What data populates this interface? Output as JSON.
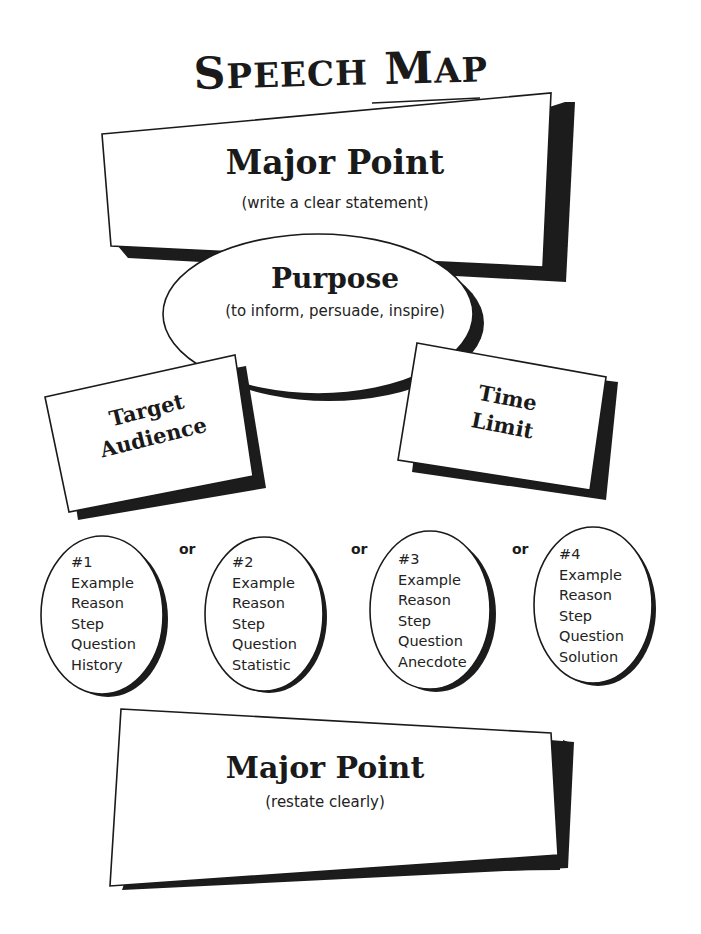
{
  "title": {
    "first_initial": "S",
    "first_rest": "PEECH",
    "second_initial": "M",
    "second_rest": "AP",
    "full": "Speech Map"
  },
  "opening_point": {
    "heading": "Major Point",
    "instruction": "(write a clear statement)"
  },
  "purpose": {
    "heading": "Purpose",
    "instruction": "(to inform, persuade, inspire)"
  },
  "target_audience": {
    "line1": "Target",
    "line2": "Audience"
  },
  "time_limit": {
    "line1": "Time",
    "line2": "Limit"
  },
  "connector_label": "or",
  "options": [
    {
      "number": "#1",
      "items": [
        "Example",
        "Reason",
        "Step",
        "Question",
        "History"
      ]
    },
    {
      "number": "#2",
      "items": [
        "Example",
        "Reason",
        "Step",
        "Question",
        "Statistic"
      ]
    },
    {
      "number": "#3",
      "items": [
        "Example",
        "Reason",
        "Step",
        "Question",
        "Anecdote"
      ]
    },
    {
      "number": "#4",
      "items": [
        "Example",
        "Reason",
        "Step",
        "Question",
        "Solution"
      ]
    }
  ],
  "closing_point": {
    "heading": "Major Point",
    "instruction": "(restate clearly)"
  },
  "colors": {
    "ink": "#1a1a1a",
    "shadow": "#1c1c1c",
    "paper": "#ffffff"
  }
}
